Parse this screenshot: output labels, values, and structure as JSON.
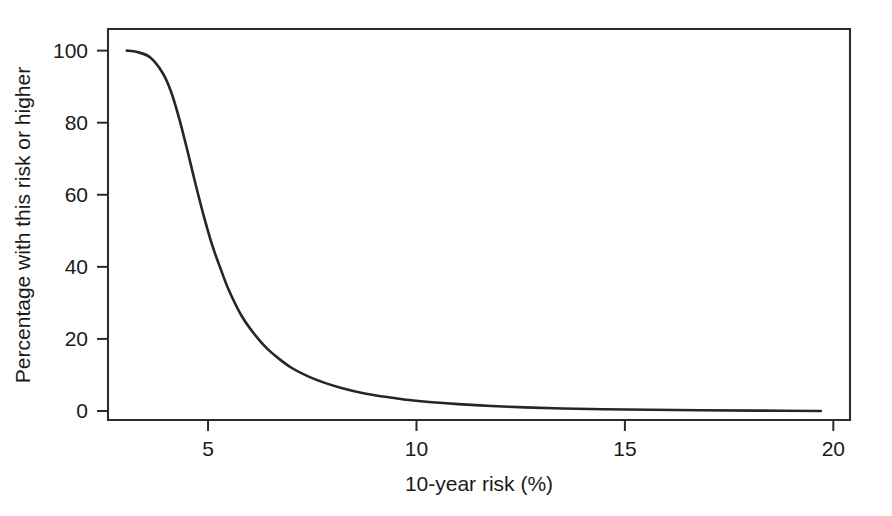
{
  "chart_data": {
    "type": "line",
    "title": "",
    "subtitle": "",
    "xlabel": "10-year risk (%)",
    "ylabel": "Percentage with this risk or higher",
    "xlim": [
      2.6,
      20.4
    ],
    "ylim": [
      -2.5,
      106
    ],
    "x_ticks": [
      5,
      10,
      15,
      20
    ],
    "x_tick_labels": [
      "5",
      "10",
      "15",
      "20"
    ],
    "y_ticks": [
      0,
      20,
      40,
      60,
      80,
      100
    ],
    "y_tick_labels": [
      "0",
      "20",
      "40",
      "60",
      "80",
      "100"
    ],
    "grid": false,
    "legend": null,
    "legend_position": "none",
    "frame": "box",
    "line_color": "#262626",
    "axis_color": "#2b2b2b",
    "background_color": "#ffffff",
    "series": [
      {
        "name": "Cumulative distribution of 10-year risk",
        "x": [
          3.05,
          3.3,
          3.6,
          3.9,
          4.1,
          4.3,
          4.5,
          4.7,
          4.9,
          5.1,
          5.3,
          5.5,
          5.8,
          6.1,
          6.4,
          6.7,
          7.0,
          7.4,
          7.8,
          8.2,
          8.7,
          9.2,
          9.7,
          10.3,
          11.0,
          11.8,
          12.6,
          13.5,
          14.5,
          15.6,
          16.8,
          18.2,
          19.7
        ],
        "y": [
          100.0,
          99.6,
          98.2,
          94.0,
          89.0,
          81.5,
          72.5,
          63.0,
          54.0,
          46.0,
          39.5,
          33.5,
          26.5,
          21.5,
          17.5,
          14.5,
          12.0,
          9.6,
          7.8,
          6.4,
          5.0,
          4.0,
          3.2,
          2.5,
          1.9,
          1.4,
          1.0,
          0.7,
          0.5,
          0.35,
          0.2,
          0.1,
          0.0
        ]
      }
    ]
  },
  "axes": {
    "x_axis_name": "10-year-risk-axis",
    "y_axis_name": "percentage-axis"
  }
}
